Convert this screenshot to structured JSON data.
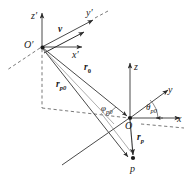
{
  "figure": {
    "type": "vector-coordinate-diagram",
    "background_color": "#ffffff",
    "line_color": "#404040",
    "text_color": "#1a1a1a"
  },
  "frames": {
    "primed": {
      "origin_label": "O",
      "origin_prime": "′",
      "axes": [
        {
          "name": "z-prime-axis",
          "label": "z",
          "prime": "′"
        },
        {
          "name": "y-prime-axis",
          "label": "y",
          "prime": "′"
        },
        {
          "name": "x-prime-axis",
          "label": "x",
          "prime": "′"
        }
      ]
    },
    "unprimed": {
      "origin_label": "O",
      "axes": [
        {
          "name": "z-axis",
          "label": "z"
        },
        {
          "name": "y-axis",
          "label": "y"
        },
        {
          "name": "x-axis",
          "label": "x"
        }
      ]
    }
  },
  "vectors": [
    {
      "name": "velocity-vector",
      "symbol": "v",
      "subscript": ""
    },
    {
      "name": "r-zero-vector",
      "symbol": "r",
      "subscript": "0"
    },
    {
      "name": "r-p-zero-vector",
      "symbol": "r",
      "subscript": "p0"
    },
    {
      "name": "r-p-vector",
      "symbol": "r",
      "subscript": "p"
    }
  ],
  "angles": [
    {
      "name": "phi-p0-angle",
      "symbol": "φ",
      "subscript": "p0"
    },
    {
      "name": "theta-p0-angle",
      "symbol": "θ",
      "subscript": "p0"
    }
  ],
  "points": [
    {
      "name": "point-p",
      "label": "p"
    }
  ]
}
